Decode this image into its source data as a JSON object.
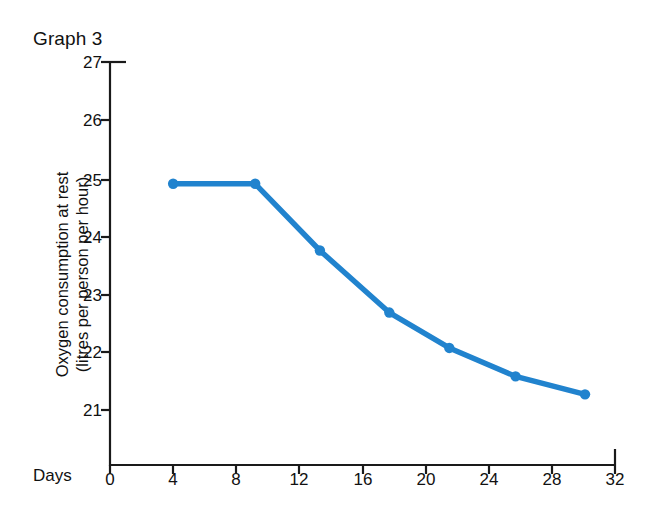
{
  "caption": "Graph 3",
  "chart_data": {
    "type": "line",
    "title": "Graph 3",
    "xlabel": "Days",
    "ylabel": "Oxygen consumption at rest (litres per person per hour)",
    "ylabel_line1": "Oxygen consumption at rest",
    "ylabel_line2": "(litres per person per hour)",
    "xlim": [
      0,
      32
    ],
    "ylim": [
      20.4,
      27
    ],
    "xticks": [
      0,
      4,
      8,
      12,
      16,
      20,
      24,
      28,
      32
    ],
    "yticks": [
      21,
      22,
      23,
      24,
      25,
      26,
      27
    ],
    "xtick_labels": [
      "0",
      "4",
      "8",
      "12",
      "16",
      "20",
      "24",
      "28",
      "32"
    ],
    "ytick_labels": [
      "21",
      "22",
      "23",
      "24",
      "25",
      "26",
      "27"
    ],
    "grid": false,
    "legend": "none",
    "series": [
      {
        "name": "Oxygen consumption at rest",
        "color": "#2183ce",
        "marker": "circle",
        "x": [
          4.0,
          9.2,
          13.3,
          17.7,
          21.5,
          25.7,
          30.1
        ],
        "values": [
          24.9,
          24.9,
          23.75,
          22.68,
          22.07,
          21.58,
          21.27
        ]
      }
    ]
  },
  "axes": {
    "frame_color": "#1a1a1a",
    "line_color": "#2183ce"
  }
}
